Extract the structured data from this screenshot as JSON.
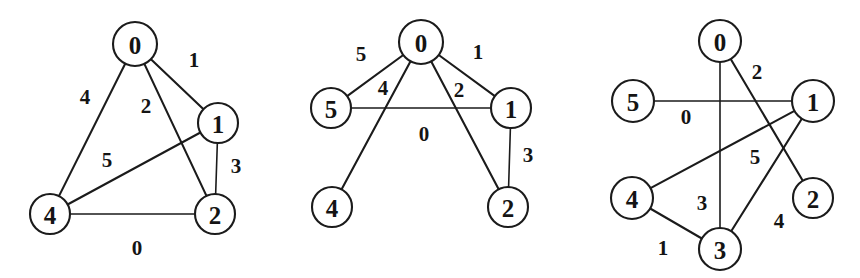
{
  "figure": {
    "panel_count": 3,
    "node_radius": 21,
    "stroke_color": "#1b1b1b",
    "background_color": "#ffffff"
  },
  "graphs": [
    {
      "name": "graph-1",
      "nodes": [
        {
          "id": "0",
          "label": "0",
          "cx": 135,
          "cy": 44,
          "r": 22
        },
        {
          "id": "1",
          "label": "1",
          "cx": 218,
          "cy": 123,
          "r": 20
        },
        {
          "id": "2",
          "label": "2",
          "cx": 215,
          "cy": 214,
          "r": 20
        },
        {
          "id": "4",
          "label": "4",
          "cx": 50,
          "cy": 214,
          "r": 20
        }
      ],
      "edges": [
        {
          "from": "0",
          "to": "1",
          "weight": "1",
          "lx": 194,
          "ly": 60
        },
        {
          "from": "0",
          "to": "2",
          "weight": "2",
          "lx": 146,
          "ly": 106
        },
        {
          "from": "0",
          "to": "4",
          "weight": "4",
          "lx": 85,
          "ly": 97
        },
        {
          "from": "1",
          "to": "2",
          "weight": "3",
          "lx": 236,
          "ly": 166
        },
        {
          "from": "1",
          "to": "4",
          "weight": "5",
          "lx": 107,
          "ly": 160
        },
        {
          "from": "4",
          "to": "2",
          "weight": "0",
          "lx": 137,
          "ly": 248
        }
      ]
    },
    {
      "name": "graph-2",
      "nodes": [
        {
          "id": "0",
          "label": "0",
          "cx": 421,
          "cy": 42,
          "r": 22
        },
        {
          "id": "1",
          "label": "1",
          "cx": 511,
          "cy": 108,
          "r": 20
        },
        {
          "id": "2",
          "label": "2",
          "cx": 508,
          "cy": 207,
          "r": 20
        },
        {
          "id": "4",
          "label": "4",
          "cx": 332,
          "cy": 207,
          "r": 20
        },
        {
          "id": "5",
          "label": "5",
          "cx": 331,
          "cy": 108,
          "r": 20
        }
      ],
      "edges": [
        {
          "from": "0",
          "to": "5",
          "weight": "5",
          "lx": 361,
          "ly": 54
        },
        {
          "from": "0",
          "to": "1",
          "weight": "1",
          "lx": 478,
          "ly": 52
        },
        {
          "from": "0",
          "to": "4",
          "weight": "4",
          "lx": 383,
          "ly": 88
        },
        {
          "from": "0",
          "to": "2",
          "weight": "2",
          "lx": 459,
          "ly": 90
        },
        {
          "from": "5",
          "to": "1",
          "weight": "0",
          "lx": 424,
          "ly": 134
        },
        {
          "from": "1",
          "to": "2",
          "weight": "3",
          "lx": 528,
          "ly": 155
        }
      ]
    },
    {
      "name": "graph-3",
      "nodes": [
        {
          "id": "0",
          "label": "0",
          "cx": 720,
          "cy": 41,
          "r": 21
        },
        {
          "id": "1",
          "label": "1",
          "cx": 813,
          "cy": 101,
          "r": 21
        },
        {
          "id": "2",
          "label": "2",
          "cx": 813,
          "cy": 198,
          "r": 20
        },
        {
          "id": "3",
          "label": "3",
          "cx": 720,
          "cy": 249,
          "r": 21
        },
        {
          "id": "4",
          "label": "4",
          "cx": 632,
          "cy": 198,
          "r": 21
        },
        {
          "id": "5",
          "label": "5",
          "cx": 633,
          "cy": 101,
          "r": 21
        }
      ],
      "edges": [
        {
          "from": "0",
          "to": "2",
          "weight": "2",
          "lx": 757,
          "ly": 72
        },
        {
          "from": "0",
          "to": "3",
          "weight": "3",
          "lx": 702,
          "ly": 203
        },
        {
          "from": "5",
          "to": "1",
          "weight": "0",
          "lx": 686,
          "ly": 117
        },
        {
          "from": "4",
          "to": "1",
          "weight": "5",
          "lx": 755,
          "ly": 157
        },
        {
          "from": "1",
          "to": "3",
          "weight": "4",
          "lx": 779,
          "ly": 221
        },
        {
          "from": "4",
          "to": "3",
          "weight": "1",
          "lx": 663,
          "ly": 248
        }
      ]
    }
  ]
}
